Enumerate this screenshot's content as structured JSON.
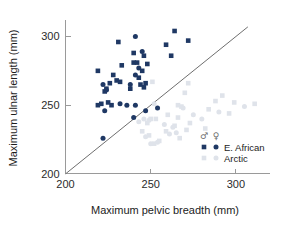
{
  "chart_data": {
    "type": "scatter",
    "title": "",
    "xlabel": "Maximum pelvic breadth (mm)",
    "ylabel": "Maximum ulnar length (mm)",
    "xlim": [
      195,
      320
    ],
    "ylim": [
      197,
      312
    ],
    "xticks": [
      200,
      250,
      300
    ],
    "yticks": [
      200,
      250,
      300
    ],
    "xtick_labels": [
      "200",
      "250",
      "300"
    ],
    "ytick_labels": [
      "200",
      "250",
      "300"
    ],
    "grid": false,
    "legend_position": "bottom-right",
    "annotations": [
      {
        "name": "identity-reference-line",
        "type": "line",
        "x0": 200,
        "y0": 200,
        "x1": 307,
        "y1": 307,
        "color": "#6e6e6e"
      }
    ],
    "legend": {
      "male_symbol": "♂",
      "female_symbol": "♀",
      "rows": [
        {
          "label": "E. African",
          "color": "#1f3864"
        },
        {
          "label": "Arctic",
          "color": "#dfe3ea"
        }
      ]
    },
    "series": [
      {
        "name": "E. African male",
        "group": "E. African",
        "sex": "male",
        "marker": "square",
        "color": "#1f3864",
        "points": [
          [
            264,
            304
          ],
          [
            231,
            296
          ],
          [
            272,
            297
          ],
          [
            259,
            294
          ],
          [
            240,
            288
          ],
          [
            246,
            286
          ],
          [
            262,
            286
          ],
          [
            240,
            281
          ],
          [
            242,
            281
          ],
          [
            248,
            280
          ],
          [
            233,
            279
          ],
          [
            245,
            275
          ],
          [
            219,
            275
          ],
          [
            228,
            272
          ],
          [
            243,
            270
          ],
          [
            247,
            266
          ],
          [
            246,
            263
          ],
          [
            226,
            266
          ],
          [
            232,
            267
          ],
          [
            224,
            262
          ],
          [
            223,
            260
          ],
          [
            225,
            252
          ],
          [
            221,
            251
          ],
          [
            219,
            250
          ],
          [
            227,
            250
          ],
          [
            244,
            265
          ],
          [
            230,
            268
          ],
          [
            238,
            262
          ]
        ]
      },
      {
        "name": "E. African female",
        "group": "E. African",
        "sex": "female",
        "marker": "circle",
        "color": "#1f3864",
        "points": [
          [
            241,
            300
          ],
          [
            245,
            289
          ],
          [
            243,
            277
          ],
          [
            241,
            272
          ],
          [
            238,
            265
          ],
          [
            222,
            265
          ],
          [
            224,
            261
          ],
          [
            232,
            251
          ],
          [
            236,
            250
          ],
          [
            241,
            250
          ],
          [
            254,
            248
          ],
          [
            247,
            246
          ],
          [
            223,
            246
          ],
          [
            240,
            241
          ],
          [
            222,
            226
          ]
        ]
      },
      {
        "name": "Arctic male",
        "group": "Arctic",
        "sex": "male",
        "marker": "square",
        "color": "#dfe3ea",
        "points": [
          [
            251,
            267
          ],
          [
            272,
            266
          ],
          [
            270,
            259
          ],
          [
            266,
            250
          ],
          [
            268,
            249
          ],
          [
            288,
            253
          ],
          [
            299,
            252
          ],
          [
            311,
            251
          ],
          [
            292,
            257
          ],
          [
            284,
            247
          ],
          [
            296,
            244
          ],
          [
            260,
            243
          ],
          [
            266,
            241
          ],
          [
            250,
            240
          ],
          [
            253,
            240
          ],
          [
            248,
            237
          ],
          [
            273,
            237
          ],
          [
            264,
            235
          ],
          [
            271,
            232
          ],
          [
            282,
            233
          ],
          [
            249,
            228
          ],
          [
            255,
            224
          ],
          [
            252,
            222
          ],
          [
            267,
            226
          ],
          [
            259,
            231
          ],
          [
            245,
            231
          ]
        ]
      },
      {
        "name": "Arctic female",
        "group": "Arctic",
        "sex": "female",
        "marker": "circle",
        "color": "#dfe3ea",
        "points": [
          [
            252,
            251
          ],
          [
            246,
            240
          ],
          [
            249,
            239
          ],
          [
            258,
            236
          ],
          [
            263,
            234
          ],
          [
            261,
            229
          ],
          [
            254,
            223
          ],
          [
            250,
            222
          ],
          [
            247,
            227
          ],
          [
            275,
            243
          ],
          [
            269,
            248
          ],
          [
            280,
            240
          ],
          [
            290,
            245
          ],
          [
            305,
            249
          ],
          [
            243,
            238
          ],
          [
            265,
            230
          ]
        ]
      }
    ]
  }
}
